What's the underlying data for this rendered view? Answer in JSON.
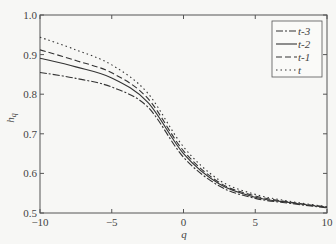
{
  "chart_data": {
    "type": "line",
    "title": "",
    "xlabel": "q",
    "ylabel": "h_q",
    "xlim": [
      -10,
      10
    ],
    "ylim": [
      0.5,
      1.0
    ],
    "xticks": [
      -10,
      -5,
      0,
      5,
      10
    ],
    "xtick_labels": [
      "−10",
      "−5",
      "0",
      "5",
      "10"
    ],
    "yticks": [
      0.5,
      0.6,
      0.7,
      0.8,
      0.9,
      1.0
    ],
    "ytick_labels": [
      "0.5",
      "0.6",
      "0.7",
      "0.8",
      "0.9",
      "1.0"
    ],
    "grid": false,
    "legend_position": "upper right",
    "x": [
      -10,
      -7.5,
      -5,
      -2.5,
      0,
      2.5,
      5,
      7.5,
      10
    ],
    "series": [
      {
        "name": "t-3",
        "style": "dashdot",
        "values": [
          0.855,
          0.84,
          0.818,
          0.768,
          0.641,
          0.568,
          0.537,
          0.524,
          0.513
        ]
      },
      {
        "name": "t-2",
        "style": "solid",
        "values": [
          0.891,
          0.869,
          0.841,
          0.78,
          0.65,
          0.573,
          0.54,
          0.526,
          0.514
        ]
      },
      {
        "name": "t-1",
        "style": "dashed",
        "values": [
          0.912,
          0.885,
          0.854,
          0.79,
          0.657,
          0.577,
          0.543,
          0.527,
          0.515
        ]
      },
      {
        "name": "t",
        "style": "dotted",
        "values": [
          0.944,
          0.912,
          0.874,
          0.803,
          0.667,
          0.583,
          0.547,
          0.529,
          0.516
        ]
      }
    ],
    "legend": [
      "t-3",
      "t-2",
      "t-1",
      "t"
    ]
  }
}
